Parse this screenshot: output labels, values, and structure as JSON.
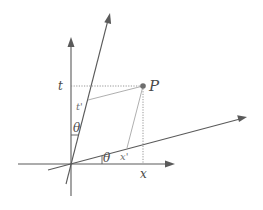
{
  "diagram": {
    "labels": {
      "point": "P",
      "t_axis": "t",
      "x_axis": "x",
      "t_prime": "t'",
      "x_prime": "x'",
      "theta_t": "θ",
      "theta_x": "θ"
    },
    "colors": {
      "axis": "#5a5a5a",
      "dotted": "#8a8a8a",
      "point": "#6e6e6e",
      "background": "#ffffff"
    },
    "geometry": {
      "origin": [
        71,
        164
      ],
      "point_P": [
        143,
        86
      ],
      "t_foot": [
        71,
        86
      ],
      "x_foot": [
        143,
        164
      ],
      "t_prime_foot": [
        87,
        100
      ],
      "x_prime_foot": [
        127,
        148
      ]
    }
  }
}
